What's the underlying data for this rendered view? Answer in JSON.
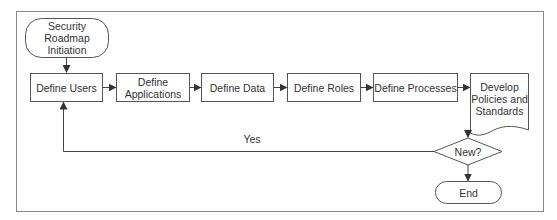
{
  "diagram": {
    "type": "flowchart",
    "colors": {
      "stroke": "#555555",
      "text": "#333333",
      "frame": "#888888",
      "background": "#ffffff"
    },
    "nodes": {
      "start": {
        "label": "Security Roadmap Initiation",
        "shape": "terminal"
      },
      "define_users": {
        "label": "Define Users",
        "shape": "process"
      },
      "define_applications": {
        "label": "Define Applications",
        "shape": "process"
      },
      "define_data": {
        "label": "Define Data",
        "shape": "process"
      },
      "define_roles": {
        "label": "Define Roles",
        "shape": "process"
      },
      "define_processes": {
        "label": "Define Processes",
        "shape": "process"
      },
      "develop_policies": {
        "label": "Develop Policies and Standards",
        "shape": "document"
      },
      "decision_new": {
        "label": "New?",
        "shape": "decision"
      },
      "end": {
        "label": "End",
        "shape": "terminal"
      }
    },
    "edges": [
      {
        "from": "start",
        "to": "define_users",
        "label": ""
      },
      {
        "from": "define_users",
        "to": "define_applications",
        "label": ""
      },
      {
        "from": "define_applications",
        "to": "define_data",
        "label": ""
      },
      {
        "from": "define_data",
        "to": "define_roles",
        "label": ""
      },
      {
        "from": "define_roles",
        "to": "define_processes",
        "label": ""
      },
      {
        "from": "define_processes",
        "to": "develop_policies",
        "label": ""
      },
      {
        "from": "develop_policies",
        "to": "decision_new",
        "label": ""
      },
      {
        "from": "decision_new",
        "to": "define_users",
        "label": "Yes"
      },
      {
        "from": "decision_new",
        "to": "end",
        "label": ""
      }
    ],
    "edge_labels": {
      "yes": "Yes"
    }
  }
}
